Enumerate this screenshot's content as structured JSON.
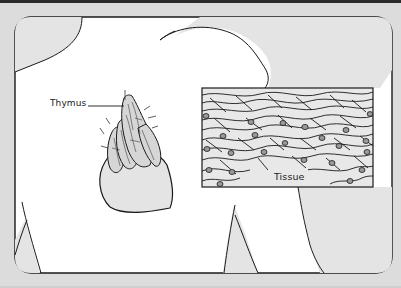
{
  "figure": {
    "type": "anatomical illustration",
    "labels": {
      "thymus": "Thymus",
      "tissue": "Tissue"
    }
  },
  "colors": {
    "page_background": "#dcdcdc",
    "frame_fill": "#ffffff",
    "body_fill": "#e4e4e4",
    "line": "#1a1a1a",
    "inset_fill": "#e8e8e8"
  }
}
